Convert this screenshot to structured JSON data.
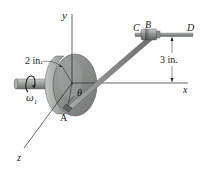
{
  "figure": {
    "axes": {
      "x_label": "x",
      "y_label": "y",
      "z_label": "z"
    },
    "points": {
      "A": "A",
      "B": "B",
      "C": "C",
      "D": "D"
    },
    "dimensions": {
      "disk_radius": "2 in.",
      "rod_height": "3 in."
    },
    "symbols": {
      "omega": "ω",
      "omega_sub": "1",
      "theta": "θ"
    },
    "colors": {
      "line": "#2a2a2a",
      "disk_face": "#8a8f8c",
      "disk_rim": "#b8bcb9",
      "disk_shadow": "#6f7471",
      "rod": "#7d827f",
      "collar": "#8c918e",
      "collar_highlight": "#c4c8c5",
      "background": "#ffffff"
    }
  }
}
